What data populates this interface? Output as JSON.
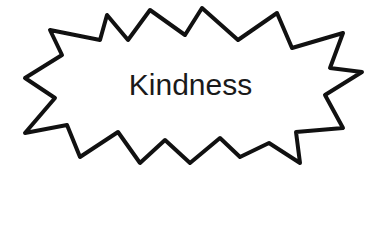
{
  "diagram": {
    "shape": "explosion-burst",
    "label": "Kindness",
    "stroke_color": "#111111",
    "fill_color": "#ffffff"
  }
}
